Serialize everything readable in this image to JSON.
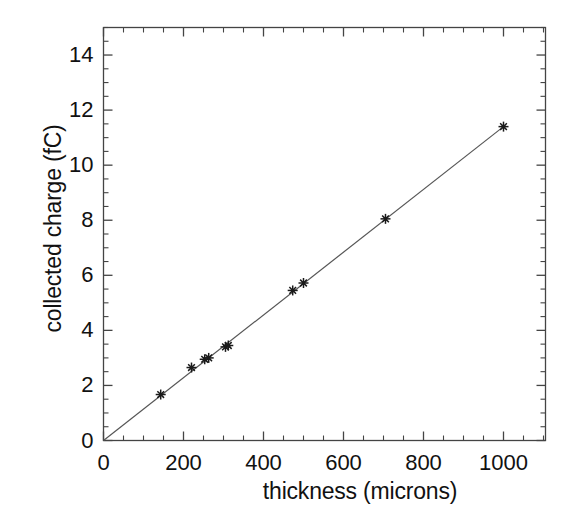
{
  "chart_data": {
    "type": "scatter",
    "title": "",
    "subtitle": "",
    "xlabel": "thickness (microns)",
    "ylabel": "collected charge (fC)",
    "xlim": [
      0,
      1105
    ],
    "ylim": [
      0,
      15
    ],
    "xticks": [
      0,
      200,
      400,
      600,
      800,
      1000
    ],
    "xtick_labels": [
      "0",
      "200",
      "400",
      "600",
      "800",
      "1000"
    ],
    "yticks": [
      0,
      2,
      4,
      6,
      8,
      10,
      12,
      14
    ],
    "ytick_labels": [
      "0",
      "2",
      "4",
      "6",
      "8",
      "10",
      "12",
      "14"
    ],
    "x_minor_tick_step": 50,
    "y_minor_tick_step": 0.5,
    "grid": false,
    "legend": null,
    "legend_position": "none",
    "marker": "star-asterisk",
    "marker_color": "#1a1a1a",
    "line_color": "#555555",
    "frame_color": "#444444",
    "background": "#ffffff",
    "series": [
      {
        "name": "measured points",
        "type": "scatter",
        "x": [
          143,
          220,
          253,
          263,
          305,
          312,
          473,
          500,
          705,
          1000
        ],
        "y": [
          1.67,
          2.65,
          2.95,
          3.0,
          3.4,
          3.45,
          5.45,
          5.72,
          8.05,
          11.4
        ]
      },
      {
        "name": "linear fit",
        "type": "line",
        "x": [
          0,
          1000
        ],
        "y": [
          0.0,
          11.4
        ],
        "slope": 0.0114,
        "intercept": 0.0
      }
    ]
  },
  "axes": {
    "x_label": "thickness (microns)",
    "y_label": "collected charge (fC)"
  }
}
